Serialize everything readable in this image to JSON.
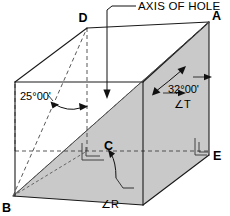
{
  "figure": {
    "title": "AXIS OF HOLE",
    "vertices": [
      {
        "id": "A",
        "label": "A",
        "x": 209,
        "y": 22
      },
      {
        "id": "D",
        "label": "D",
        "x": 87,
        "y": 28
      },
      {
        "id": "B",
        "label": "B",
        "x": 13,
        "y": 196
      },
      {
        "id": "C",
        "label": "C",
        "x": 100,
        "y": 151
      },
      {
        "id": "E",
        "label": "E",
        "x": 209,
        "y": 155
      }
    ],
    "dimensions": [
      {
        "id": "angle-25",
        "label": "25°00'"
      },
      {
        "id": "angle-32",
        "label": "32°00'"
      }
    ],
    "angle_symbols": [
      {
        "id": "angle-T",
        "label": "∠T"
      },
      {
        "id": "angle-R",
        "label": "∠R"
      }
    ],
    "colors": {
      "shade_fill": "#c9c9c9",
      "line": "#1a1a1a",
      "background": "#ffffff"
    }
  }
}
